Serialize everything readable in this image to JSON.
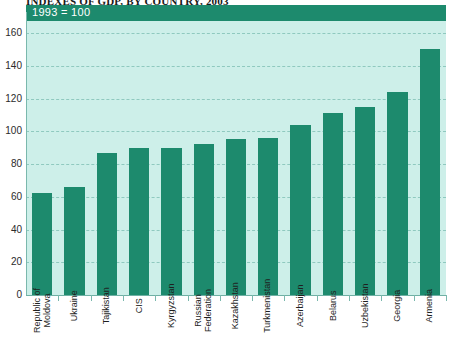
{
  "title": "INDEXES OF GDP, BY COUNTRY, 2003",
  "header": {
    "base_label": "1993 = 100"
  },
  "colors": {
    "bar": "#1d8a6d",
    "plot_background": "#cdefe9",
    "header_band": "#1d8a6d",
    "gridline": "#8fc9bf",
    "axis": "#7ab8ad",
    "text": "#1f1f1f",
    "header_text": "#ffffff"
  },
  "chart_data": {
    "type": "bar",
    "title": "INDEXES OF GDP, BY COUNTRY, 2003",
    "subtitle": "1993 = 100",
    "xlabel": "",
    "ylabel": "",
    "ylim": [
      0,
      160
    ],
    "yticks": [
      0,
      20,
      40,
      60,
      80,
      100,
      120,
      140,
      160
    ],
    "ytick_labels": [
      "0",
      "20",
      "40",
      "60",
      "80",
      "100",
      "120",
      "140",
      "160"
    ],
    "grid": true,
    "legend": false,
    "categories": [
      "Republic of Moldova",
      "Ukraine",
      "Tajikistan",
      "CIS",
      "Kyrgyzstan",
      "Russian Federation",
      "Kazakhstan",
      "Turkmenistan",
      "Azerbaijan",
      "Belarus",
      "Uzbekistan",
      "Georgia",
      "Armenia"
    ],
    "values": [
      62,
      66,
      87,
      90,
      90,
      92,
      95,
      96,
      104,
      111,
      115,
      124,
      150
    ]
  }
}
